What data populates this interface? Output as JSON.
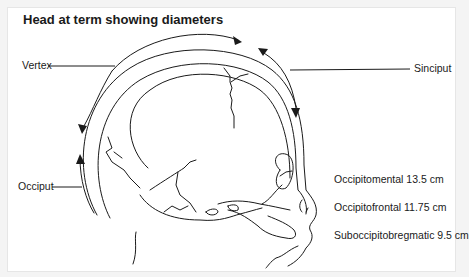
{
  "title": "Head at term showing diameters",
  "labels": {
    "vertex": "Vertex",
    "sinciput": "Sinciput",
    "occiput": "Occiput"
  },
  "diameters": [
    {
      "name": "Occipitomental",
      "value": "13.5 cm",
      "text": "Occipitomental 13.5 cm"
    },
    {
      "name": "Occipitofrontal",
      "value": "11.75 cm",
      "text": "Occipitofrontal 11.75 cm"
    },
    {
      "name": "Suboccipitobregmatic",
      "value": "9.5 cm",
      "text": "Suboccipitobregmatic 9.5 cm"
    }
  ],
  "colors": {
    "line": "#1a1a1a",
    "background": "#ffffff",
    "frame": "#f4f4f4"
  }
}
